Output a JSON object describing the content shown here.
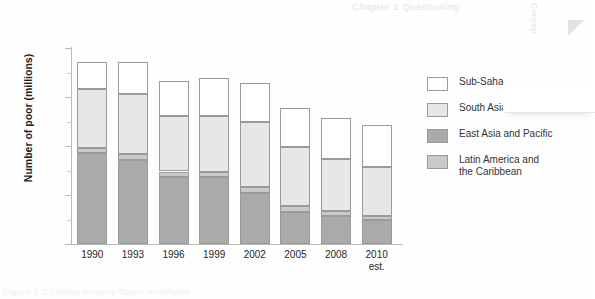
{
  "page": {
    "header_text": "Chapter 1  Questioning",
    "side_tab_text": "Concep",
    "caption": "Figure 1.3  Falling Poverty Rates worldwide"
  },
  "chart": {
    "y_axis_title": "Number of poor (millions)",
    "y_tick_labels": [
      "0",
      "500",
      "1000",
      "1500",
      "2000"
    ],
    "x_tick_labels": [
      "1990",
      "1993",
      "1996",
      "1999",
      "2002",
      "2005",
      "2008",
      "2010"
    ],
    "x_sublabel_2010": "est.",
    "legend": [
      {
        "label": "Sub-Saha",
        "color": "#ffffff",
        "name": "sub-saharan-africa"
      },
      {
        "label": "South Asia",
        "color": "#e7e7e7",
        "name": "south-asia"
      },
      {
        "label": "East Asia and Pacific",
        "color": "#aaaaaa",
        "name": "east-asia-and-pacific"
      },
      {
        "label": "Latin America and\nthe Caribbean",
        "color": "#c9c9c9",
        "name": "latin-america-and-the-caribbean"
      }
    ]
  },
  "chart_data": {
    "type": "bar",
    "subtype": "stacked",
    "title": "",
    "xlabel": "",
    "ylabel": "Number of poor (millions)",
    "ylim": [
      0,
      2000
    ],
    "ytick_step": 500,
    "yminor_step": 250,
    "grid": false,
    "legend_position": "right",
    "categories": [
      "1990",
      "1993",
      "1996",
      "1999",
      "2002",
      "2005",
      "2008",
      "2010 est."
    ],
    "series": [
      {
        "name": "East Asia and Pacific",
        "color": "#aaaaaa",
        "values": [
          930,
          860,
          685,
          680,
          525,
          330,
          285,
          240
        ]
      },
      {
        "name": "Latin America and the Caribbean",
        "color": "#c9c9c9",
        "values": [
          50,
          55,
          55,
          55,
          60,
          60,
          55,
          50
        ]
      },
      {
        "name": "South Asia",
        "color": "#e7e7e7",
        "values": [
          600,
          620,
          570,
          570,
          655,
          600,
          530,
          495
        ]
      },
      {
        "name": "Sub-Saharan Africa",
        "color": "#ffffff",
        "values": [
          275,
          320,
          350,
          385,
          400,
          395,
          420,
          425
        ]
      }
    ],
    "totals": [
      1855,
      1855,
      1660,
      1690,
      1640,
      1385,
      1290,
      1210
    ]
  }
}
